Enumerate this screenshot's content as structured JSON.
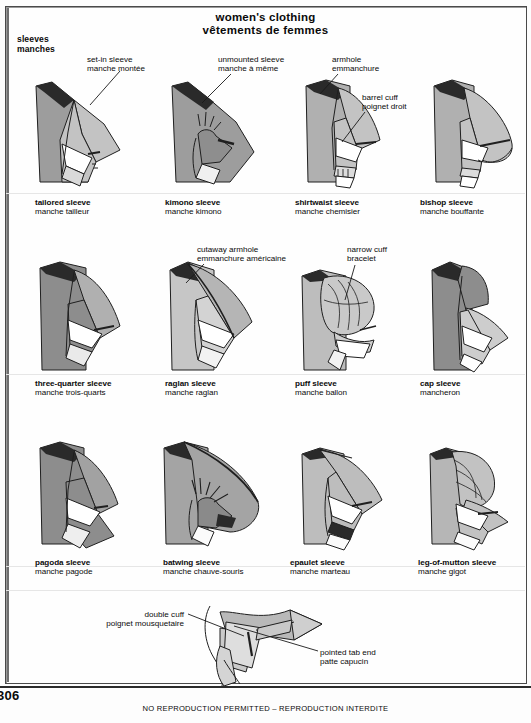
{
  "page": {
    "title_en": "women's clothing",
    "title_fr": "vêtements de femmes",
    "section_en": "sleeves",
    "section_fr": "manches",
    "folio": "306",
    "footnote": "NO REPRODUCTION PERMITTED – REPRODUCTION INTERDITE",
    "colors": {
      "ink": "#1a1a1a",
      "fill_dark": "#8f8f8f",
      "fill_mid": "#b3b3b3",
      "fill_light": "#d6d6d6",
      "fill_white": "#ffffff",
      "frame": "#4a4a4a"
    }
  },
  "callouts": [
    {
      "id": "set-in-sleeve",
      "en": "set-in sleeve",
      "fr": "manche montée"
    },
    {
      "id": "unmounted-sleeve",
      "en": "unmounted sleeve",
      "fr": "manche à même"
    },
    {
      "id": "armhole",
      "en": "armhole",
      "fr": "emmanchure"
    },
    {
      "id": "barrel-cuff",
      "en": "barrel cuff",
      "fr": "poignet droit"
    },
    {
      "id": "cutaway-armhole",
      "en": "cutaway armhole",
      "fr": "emmanchure américaine"
    },
    {
      "id": "narrow-cuff",
      "en": "narrow cuff",
      "fr": "bracelet"
    },
    {
      "id": "double-cuff",
      "en": "double cuff",
      "fr": "poignet mousquetaire"
    },
    {
      "id": "pointed-tab-end",
      "en": "pointed tab end",
      "fr": "patte capucin"
    }
  ],
  "figures": [
    {
      "id": "tailored-sleeve",
      "en": "tailored sleeve",
      "fr": "manche tailleur",
      "row": 1,
      "col": 1
    },
    {
      "id": "kimono-sleeve",
      "en": "kimono sleeve",
      "fr": "manche kimono",
      "row": 1,
      "col": 2
    },
    {
      "id": "shirtwaist-sleeve",
      "en": "shirtwaist sleeve",
      "fr": "manche chemisier",
      "row": 1,
      "col": 3
    },
    {
      "id": "bishop-sleeve",
      "en": "bishop sleeve",
      "fr": "manche bouffante",
      "row": 1,
      "col": 4
    },
    {
      "id": "three-quarter-sleeve",
      "en": "three-quarter sleeve",
      "fr": "manche trois-quarts",
      "row": 2,
      "col": 1
    },
    {
      "id": "raglan-sleeve",
      "en": "raglan sleeve",
      "fr": "manche raglan",
      "row": 2,
      "col": 2
    },
    {
      "id": "puff-sleeve",
      "en": "puff sleeve",
      "fr": "manche ballon",
      "row": 2,
      "col": 3
    },
    {
      "id": "cap-sleeve",
      "en": "cap sleeve",
      "fr": "mancheron",
      "row": 2,
      "col": 4
    },
    {
      "id": "pagoda-sleeve",
      "en": "pagoda sleeve",
      "fr": "manche pagode",
      "row": 3,
      "col": 1
    },
    {
      "id": "batwing-sleeve",
      "en": "batwing sleeve",
      "fr": "manche chauve-souris",
      "row": 3,
      "col": 2
    },
    {
      "id": "epaulet-sleeve",
      "en": "epaulet sleeve",
      "fr": "manche marteau",
      "row": 3,
      "col": 3
    },
    {
      "id": "leg-of-mutton-sleeve",
      "en": "leg-of-mutton sleeve",
      "fr": "manche gigot",
      "row": 3,
      "col": 4
    }
  ]
}
